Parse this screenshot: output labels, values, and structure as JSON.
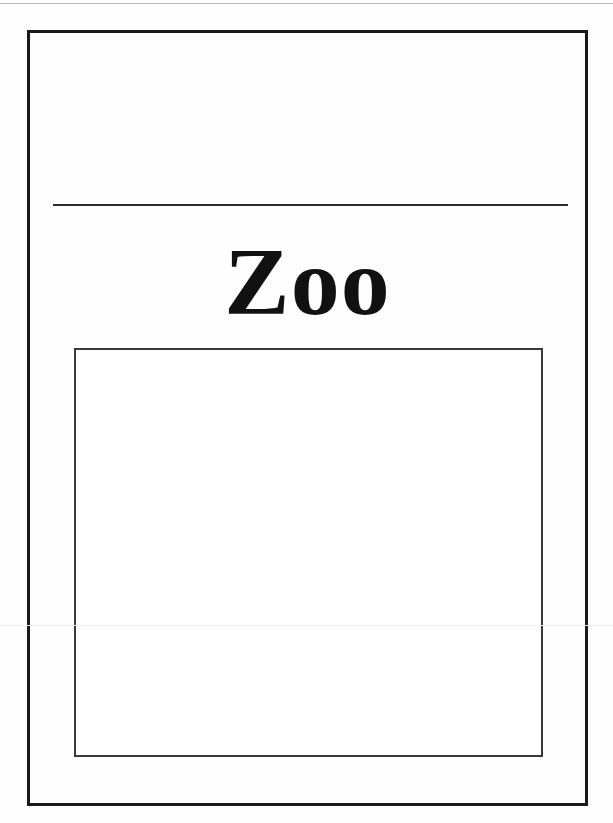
{
  "document": {
    "type": "scanned-worksheet-page",
    "title": "Zoo",
    "background_color": "#fefefe",
    "ink_color": "#111111"
  },
  "frame": {
    "name": "outer-border",
    "color": "#1a1a1a",
    "thickness_px": 3
  },
  "rule": {
    "name": "title-rule",
    "color": "#2b2b2b",
    "thickness_px": 2
  },
  "caption": {
    "word": "Zoo",
    "style": "bold-serif",
    "alignment": "center",
    "color": "#111111"
  },
  "drawing_box": {
    "label": "",
    "placeholder": "",
    "border_color": "#3a3a3a",
    "fill_color": "#ffffff",
    "content": ""
  },
  "regions": {
    "upper_blank_label": "",
    "scan_artifact_label": ""
  }
}
